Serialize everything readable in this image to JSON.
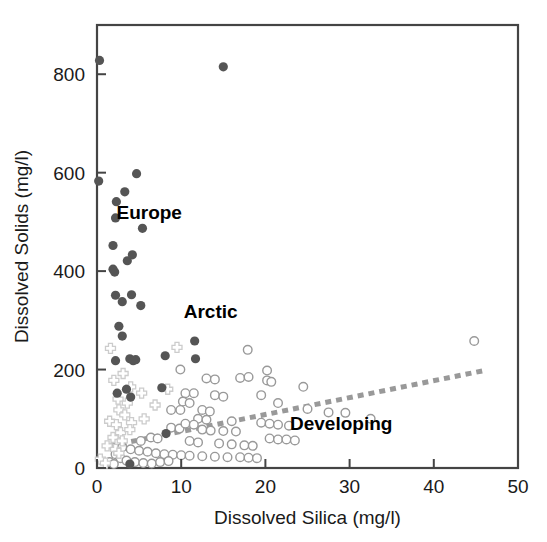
{
  "chart_data": {
    "type": "scatter",
    "title": "",
    "xlabel": "Dissolved Silica (mg/l)",
    "ylabel": "Dissolved Solids (mg/l)",
    "xlim": [
      0,
      50
    ],
    "ylim": [
      0,
      900
    ],
    "xticks": [
      0,
      10,
      20,
      30,
      40,
      50
    ],
    "yticks": [
      0,
      200,
      400,
      600,
      800
    ],
    "grid": false,
    "legend_position": "in-plot-annotations",
    "annotations": [
      {
        "text": "Europe",
        "x": 6.2,
        "y": 505
      },
      {
        "text": "Arctic",
        "x": 13.5,
        "y": 305
      },
      {
        "text": "Developing",
        "x": 29.0,
        "y": 78
      }
    ],
    "colors": {
      "europe_marker": "#555555",
      "arctic_marker": "#cccccc",
      "developing_marker": "#999999",
      "trend_line": "#999999",
      "axis": "#444444",
      "text": "#1a1a1a"
    },
    "trend_line": {
      "label": "Developing trend",
      "style": "dashed",
      "x_start": 1.5,
      "y_start": 45,
      "x_end": 46.0,
      "y_end": 198
    },
    "series": [
      {
        "name": "Europe",
        "marker": "filled-circle",
        "color": "#555555",
        "points": [
          [
            0.3,
            828
          ],
          [
            15.0,
            815
          ],
          [
            0.2,
            583
          ],
          [
            4.7,
            598
          ],
          [
            3.3,
            561
          ],
          [
            2.3,
            541
          ],
          [
            2.2,
            508
          ],
          [
            5.4,
            487
          ],
          [
            1.9,
            452
          ],
          [
            3.6,
            421
          ],
          [
            2.1,
            398
          ],
          [
            4.2,
            433
          ],
          [
            1.9,
            404
          ],
          [
            2.2,
            351
          ],
          [
            4.1,
            352
          ],
          [
            3.0,
            338
          ],
          [
            5.2,
            330
          ],
          [
            2.6,
            288
          ],
          [
            3.0,
            268
          ],
          [
            11.6,
            258
          ],
          [
            2.2,
            218
          ],
          [
            3.9,
            222
          ],
          [
            4.6,
            220
          ],
          [
            8.1,
            228
          ],
          [
            11.7,
            222
          ],
          [
            4.3,
            218
          ],
          [
            3.5,
            160
          ],
          [
            7.7,
            163
          ],
          [
            4.0,
            144
          ],
          [
            2.4,
            152
          ],
          [
            8.2,
            70
          ],
          [
            3.9,
            8
          ]
        ]
      },
      {
        "name": "Arctic",
        "marker": "cross",
        "color": "#cccccc",
        "points": [
          [
            1.6,
            243
          ],
          [
            9.5,
            245
          ],
          [
            2.0,
            178
          ],
          [
            4.0,
            165
          ],
          [
            5.3,
            152
          ],
          [
            8.4,
            160
          ],
          [
            3.1,
            192
          ],
          [
            2.5,
            140
          ],
          [
            3.6,
            132
          ],
          [
            6.9,
            128
          ],
          [
            2.6,
            118
          ],
          [
            3.3,
            108
          ],
          [
            1.5,
            95
          ],
          [
            2.3,
            88
          ],
          [
            4.1,
            92
          ],
          [
            2.8,
            72
          ],
          [
            1.9,
            62
          ],
          [
            3.0,
            55
          ],
          [
            1.2,
            45
          ],
          [
            2.2,
            38
          ],
          [
            0.4,
            18
          ],
          [
            1.0,
            10
          ],
          [
            5.6,
            100
          ],
          [
            3.9,
            78
          ],
          [
            2.6,
            30
          ]
        ]
      },
      {
        "name": "Developing",
        "marker": "open-circle",
        "color": "#999999",
        "points": [
          [
            44.8,
            258
          ],
          [
            17.9,
            240
          ],
          [
            9.9,
            200
          ],
          [
            20.2,
            198
          ],
          [
            13.0,
            182
          ],
          [
            14.0,
            180
          ],
          [
            17.0,
            183
          ],
          [
            18.0,
            185
          ],
          [
            20.2,
            178
          ],
          [
            20.7,
            175
          ],
          [
            24.5,
            165
          ],
          [
            10.5,
            152
          ],
          [
            11.5,
            152
          ],
          [
            14.0,
            148
          ],
          [
            15.0,
            145
          ],
          [
            19.5,
            148
          ],
          [
            10.2,
            135
          ],
          [
            11.0,
            132
          ],
          [
            21.5,
            132
          ],
          [
            25.0,
            120
          ],
          [
            8.8,
            118
          ],
          [
            9.9,
            118
          ],
          [
            12.5,
            118
          ],
          [
            13.4,
            115
          ],
          [
            27.5,
            113
          ],
          [
            29.5,
            112
          ],
          [
            32.5,
            100
          ],
          [
            12.0,
            100
          ],
          [
            13.0,
            98
          ],
          [
            16.0,
            95
          ],
          [
            19.5,
            92
          ],
          [
            20.5,
            90
          ],
          [
            21.5,
            88
          ],
          [
            22.8,
            86
          ],
          [
            8.8,
            82
          ],
          [
            9.8,
            80
          ],
          [
            12.5,
            78
          ],
          [
            13.5,
            76
          ],
          [
            15.0,
            75
          ],
          [
            16.5,
            74
          ],
          [
            6.4,
            62
          ],
          [
            7.2,
            60
          ],
          [
            5.2,
            55
          ],
          [
            11.0,
            55
          ],
          [
            12.0,
            52
          ],
          [
            14.5,
            50
          ],
          [
            16.0,
            48
          ],
          [
            17.5,
            46
          ],
          [
            18.5,
            45
          ],
          [
            3.0,
            42
          ],
          [
            4.0,
            38
          ],
          [
            5.0,
            35
          ],
          [
            6.0,
            33
          ],
          [
            7.0,
            30
          ],
          [
            8.0,
            28
          ],
          [
            9.0,
            27
          ],
          [
            10.0,
            26
          ],
          [
            11.0,
            25
          ],
          [
            12.5,
            24
          ],
          [
            14.0,
            23
          ],
          [
            15.5,
            22
          ],
          [
            17.0,
            22
          ],
          [
            18.0,
            21
          ],
          [
            19.0,
            20
          ],
          [
            2.2,
            28
          ],
          [
            2.8,
            20
          ],
          [
            3.5,
            15
          ],
          [
            4.5,
            12
          ],
          [
            5.5,
            10
          ],
          [
            6.5,
            9
          ],
          [
            7.5,
            12
          ],
          [
            8.5,
            14
          ],
          [
            1.5,
            12
          ],
          [
            2.0,
            8
          ],
          [
            20.5,
            60
          ],
          [
            21.5,
            58
          ],
          [
            22.5,
            58
          ],
          [
            23.5,
            56
          ],
          [
            10.5,
            90
          ],
          [
            11.5,
            88
          ]
        ]
      }
    ]
  },
  "axes": {
    "x_tick_labels": [
      "0",
      "10",
      "20",
      "30",
      "40",
      "50"
    ],
    "y_tick_labels": [
      "0",
      "200",
      "400",
      "600",
      "800"
    ],
    "x_axis_title": "Dissolved Silica (mg/l)",
    "y_axis_title": "Dissolved Solids (mg/l)"
  },
  "labels": {
    "europe": "Europe",
    "arctic": "Arctic",
    "developing": "Developing"
  }
}
